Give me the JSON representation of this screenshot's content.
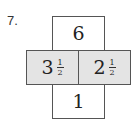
{
  "problem": {
    "number": "7.",
    "top": {
      "value": "6"
    },
    "left": {
      "whole": "3",
      "numerator": "1",
      "denominator": "2"
    },
    "right": {
      "whole": "2",
      "numerator": "1",
      "denominator": "2"
    },
    "bottom": {
      "value": "1"
    }
  },
  "colors": {
    "shaded": "#e4e4e4",
    "border": "#555555"
  }
}
